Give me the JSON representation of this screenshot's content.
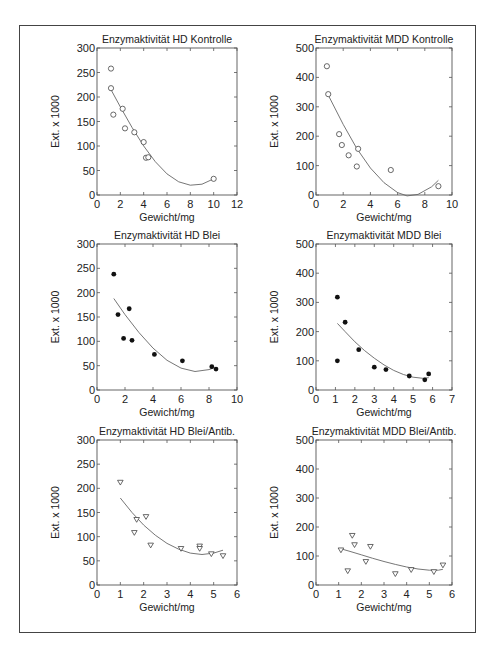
{
  "figure": {
    "ylabel": "Ext. x 1000",
    "xlabel": "Gewicht/mg"
  },
  "chart_data": [
    {
      "type": "scatter",
      "title": "Enzymaktivität HD Kontrolle",
      "xlabel": "Gewicht/mg",
      "ylabel": "Ext. x 1000",
      "xlim": [
        0,
        12
      ],
      "ylim": [
        0,
        300
      ],
      "xticks": [
        0,
        2,
        4,
        6,
        8,
        10,
        12
      ],
      "yticks": [
        0,
        50,
        100,
        150,
        200,
        250,
        300
      ],
      "marker": "open-circle",
      "points": [
        [
          1.2,
          258
        ],
        [
          1.2,
          218
        ],
        [
          1.4,
          164
        ],
        [
          2.2,
          176
        ],
        [
          2.4,
          136
        ],
        [
          3.2,
          128
        ],
        [
          4.0,
          108
        ],
        [
          4.2,
          76
        ],
        [
          4.4,
          77
        ],
        [
          10.0,
          33
        ]
      ],
      "fit": {
        "type": "polynomial",
        "x_range": [
          1.2,
          10.0
        ],
        "points": [
          [
            1.2,
            215
          ],
          [
            2,
            180
          ],
          [
            3,
            138
          ],
          [
            4,
            100
          ],
          [
            5,
            68
          ],
          [
            6,
            43
          ],
          [
            7,
            27
          ],
          [
            8,
            20
          ],
          [
            9,
            22
          ],
          [
            10,
            33
          ]
        ]
      },
      "box": {
        "x": 97,
        "y": 48,
        "w": 140,
        "h": 147
      }
    },
    {
      "type": "scatter",
      "title": "Enzymaktivität MDD Kontrolle",
      "xlabel": "Gewicht/mg",
      "ylabel": "Ext. x 1000",
      "xlim": [
        0,
        10
      ],
      "ylim": [
        0,
        500
      ],
      "xticks": [
        0,
        2,
        4,
        6,
        8,
        10
      ],
      "yticks": [
        0,
        100,
        200,
        300,
        400,
        500
      ],
      "marker": "open-circle",
      "points": [
        [
          0.8,
          438
        ],
        [
          0.9,
          343
        ],
        [
          1.7,
          207
        ],
        [
          1.9,
          170
        ],
        [
          2.4,
          135
        ],
        [
          3.0,
          97
        ],
        [
          3.1,
          157
        ],
        [
          5.5,
          85
        ],
        [
          9.0,
          30
        ]
      ],
      "fit": {
        "type": "polynomial",
        "x_range": [
          0.9,
          9.0
        ],
        "points": [
          [
            0.9,
            340
          ],
          [
            2,
            240
          ],
          [
            3,
            158
          ],
          [
            4,
            92
          ],
          [
            5,
            42
          ],
          [
            6,
            8
          ],
          [
            6.7,
            -3
          ],
          [
            7.5,
            2
          ],
          [
            8.5,
            28
          ],
          [
            9,
            50
          ]
        ]
      },
      "box": {
        "x": 316,
        "y": 48,
        "w": 136,
        "h": 147
      }
    },
    {
      "type": "scatter",
      "title": "Enzymaktivität HD Blei",
      "xlabel": "Gewicht/mg",
      "ylabel": "Ext. x 1000",
      "xlim": [
        0,
        10
      ],
      "ylim": [
        0,
        300
      ],
      "xticks": [
        0,
        2,
        4,
        6,
        8,
        10
      ],
      "yticks": [
        0,
        50,
        100,
        150,
        200,
        250,
        300
      ],
      "marker": "filled-circle",
      "points": [
        [
          1.2,
          238
        ],
        [
          1.5,
          155
        ],
        [
          1.9,
          106
        ],
        [
          2.3,
          167
        ],
        [
          2.5,
          102
        ],
        [
          4.1,
          73
        ],
        [
          6.1,
          60
        ],
        [
          8.2,
          48
        ],
        [
          8.5,
          43
        ]
      ],
      "fit": {
        "type": "polynomial",
        "x_range": [
          1.2,
          8.3
        ],
        "points": [
          [
            1.2,
            188
          ],
          [
            2,
            155
          ],
          [
            3,
            118
          ],
          [
            4,
            86
          ],
          [
            5,
            61
          ],
          [
            6,
            45
          ],
          [
            7,
            38
          ],
          [
            8,
            42
          ],
          [
            8.3,
            45
          ]
        ]
      },
      "box": {
        "x": 97,
        "y": 244,
        "w": 140,
        "h": 146
      }
    },
    {
      "type": "scatter",
      "title": "Enzymaktivität MDD Blei",
      "xlabel": "Gewicht/mg",
      "ylabel": "Ext. x 1000",
      "xlim": [
        0,
        7
      ],
      "ylim": [
        0,
        500
      ],
      "xticks": [
        0,
        1,
        2,
        3,
        4,
        5,
        6,
        7
      ],
      "yticks": [
        0,
        100,
        200,
        300,
        400,
        500
      ],
      "marker": "filled-circle",
      "points": [
        [
          1.1,
          318
        ],
        [
          1.1,
          100
        ],
        [
          1.5,
          232
        ],
        [
          2.2,
          138
        ],
        [
          3.0,
          78
        ],
        [
          3.6,
          70
        ],
        [
          4.8,
          48
        ],
        [
          5.6,
          35
        ],
        [
          5.8,
          55
        ]
      ],
      "fit": {
        "type": "polynomial",
        "x_range": [
          1.1,
          5.8
        ],
        "points": [
          [
            1.1,
            228
          ],
          [
            1.5,
            200
          ],
          [
            2,
            165
          ],
          [
            2.5,
            135
          ],
          [
            3,
            109
          ],
          [
            3.5,
            86
          ],
          [
            4,
            67
          ],
          [
            4.5,
            53
          ],
          [
            5,
            44
          ],
          [
            5.5,
            40
          ],
          [
            5.8,
            42
          ]
        ]
      },
      "box": {
        "x": 316,
        "y": 244,
        "w": 136,
        "h": 146
      }
    },
    {
      "type": "scatter",
      "title": "Enzymaktivität HD Blei/Antib.",
      "xlabel": "Gewicht/mg",
      "ylabel": "Ext. x 1000",
      "xlim": [
        0,
        6
      ],
      "ylim": [
        0,
        300
      ],
      "xticks": [
        0,
        1,
        2,
        3,
        4,
        5,
        6
      ],
      "yticks": [
        0,
        50,
        100,
        150,
        200,
        250,
        300
      ],
      "marker": "open-triangle-down",
      "points": [
        [
          1.0,
          212
        ],
        [
          1.6,
          108
        ],
        [
          1.7,
          135
        ],
        [
          2.1,
          141
        ],
        [
          2.3,
          82
        ],
        [
          3.6,
          75
        ],
        [
          4.4,
          80
        ],
        [
          4.4,
          75
        ],
        [
          4.9,
          64
        ],
        [
          5.4,
          60
        ]
      ],
      "fit": {
        "type": "polynomial",
        "x_range": [
          1.0,
          5.4
        ],
        "points": [
          [
            1.0,
            180
          ],
          [
            1.5,
            150
          ],
          [
            2,
            124
          ],
          [
            2.5,
            103
          ],
          [
            3,
            86
          ],
          [
            3.5,
            74
          ],
          [
            4,
            66
          ],
          [
            4.5,
            63
          ],
          [
            5,
            66
          ],
          [
            5.4,
            72
          ]
        ]
      },
      "box": {
        "x": 97,
        "y": 440,
        "w": 140,
        "h": 145
      }
    },
    {
      "type": "scatter",
      "title": "Enzymaktivität MDD Blei/Antib.",
      "xlabel": "Gewicht/mg",
      "ylabel": "Ext. x 1000",
      "xlim": [
        0,
        6
      ],
      "ylim": [
        0,
        500
      ],
      "xticks": [
        0,
        1,
        2,
        3,
        4,
        5,
        6
      ],
      "yticks": [
        0,
        100,
        200,
        300,
        400,
        500
      ],
      "marker": "open-triangle-down",
      "points": [
        [
          1.1,
          120
        ],
        [
          1.4,
          48
        ],
        [
          1.6,
          170
        ],
        [
          1.7,
          138
        ],
        [
          2.2,
          80
        ],
        [
          2.4,
          132
        ],
        [
          3.5,
          38
        ],
        [
          4.2,
          52
        ],
        [
          5.2,
          45
        ],
        [
          5.6,
          68
        ]
      ],
      "fit": {
        "type": "polynomial",
        "x_range": [
          1.1,
          5.6
        ],
        "points": [
          [
            1.1,
            125
          ],
          [
            1.5,
            116
          ],
          [
            2,
            104
          ],
          [
            2.5,
            92
          ],
          [
            3,
            81
          ],
          [
            3.5,
            71
          ],
          [
            4,
            62
          ],
          [
            4.5,
            55
          ],
          [
            5,
            51
          ],
          [
            5.4,
            51
          ],
          [
            5.6,
            54
          ]
        ]
      },
      "box": {
        "x": 316,
        "y": 440,
        "w": 136,
        "h": 145
      }
    }
  ]
}
